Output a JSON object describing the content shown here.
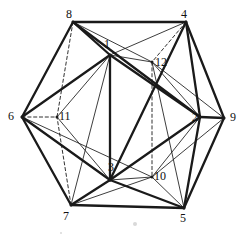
{
  "figure": {
    "type": "diagram",
    "background_color": "#ffffff",
    "line_color": "#1a1a1a",
    "label_color": "#111111",
    "width": 247,
    "height": 237
  },
  "graph_data": {
    "type": "graph",
    "vertex_count": 12,
    "edge_count": 30,
    "vertices": [
      {
        "id": "v1",
        "label": "1",
        "x": 110,
        "y": 55,
        "lx": 104,
        "ly": 38,
        "ring": "inner"
      },
      {
        "id": "v2",
        "label": "2",
        "x": 200,
        "y": 117,
        "lx": 192,
        "ly": 111,
        "ring": "inner"
      },
      {
        "id": "v3",
        "label": "3",
        "x": 110,
        "y": 180,
        "lx": 108,
        "ly": 161,
        "ring": "inner"
      },
      {
        "id": "v4",
        "label": "4",
        "x": 186,
        "y": 22,
        "lx": 181,
        "ly": 8,
        "ring": "outer"
      },
      {
        "id": "v5",
        "label": "5",
        "x": 184,
        "y": 208,
        "lx": 180,
        "ly": 212,
        "ring": "outer"
      },
      {
        "id": "v6",
        "label": "6",
        "x": 22,
        "y": 117,
        "lx": 8,
        "ly": 110,
        "ring": "outer"
      },
      {
        "id": "v7",
        "label": "7",
        "x": 71,
        "y": 205,
        "lx": 63,
        "ly": 210,
        "ring": "outer"
      },
      {
        "id": "v8",
        "label": "8",
        "x": 73,
        "y": 22,
        "lx": 66,
        "ly": 8,
        "ring": "outer"
      },
      {
        "id": "v9",
        "label": "9",
        "x": 224,
        "y": 118,
        "lx": 230,
        "ly": 111,
        "ring": "outer"
      },
      {
        "id": "v10",
        "label": "10",
        "x": 152,
        "y": 177,
        "lx": 154,
        "ly": 170,
        "ring": "inner"
      },
      {
        "id": "v11",
        "label": "11",
        "x": 57,
        "y": 117,
        "lx": 59,
        "ly": 110,
        "ring": "inner"
      },
      {
        "id": "v12",
        "label": "12",
        "x": 152,
        "y": 62,
        "lx": 155,
        "ly": 56,
        "ring": "inner"
      }
    ],
    "edges": [
      {
        "from": "v8",
        "to": "v4",
        "style": "solid",
        "weight": "bold"
      },
      {
        "from": "v4",
        "to": "v9",
        "style": "solid",
        "weight": "bold"
      },
      {
        "from": "v9",
        "to": "v5",
        "style": "solid",
        "weight": "bold"
      },
      {
        "from": "v5",
        "to": "v7",
        "style": "solid",
        "weight": "bold"
      },
      {
        "from": "v7",
        "to": "v6",
        "style": "solid",
        "weight": "bold"
      },
      {
        "from": "v6",
        "to": "v8",
        "style": "solid",
        "weight": "bold"
      },
      {
        "from": "v8",
        "to": "v1",
        "style": "solid",
        "weight": "bold"
      },
      {
        "from": "v4",
        "to": "v2",
        "style": "solid",
        "weight": "bold"
      },
      {
        "from": "v9",
        "to": "v2",
        "style": "solid",
        "weight": "bold"
      },
      {
        "from": "v5",
        "to": "v3",
        "style": "solid",
        "weight": "bold"
      },
      {
        "from": "v7",
        "to": "v3",
        "style": "solid",
        "weight": "bold"
      },
      {
        "from": "v6",
        "to": "v1",
        "style": "solid",
        "weight": "bold"
      },
      {
        "from": "v1",
        "to": "v2",
        "style": "solid",
        "weight": "bold"
      },
      {
        "from": "v2",
        "to": "v3",
        "style": "solid",
        "weight": "bold"
      },
      {
        "from": "v3",
        "to": "v1",
        "style": "solid",
        "weight": "bold"
      },
      {
        "from": "v8",
        "to": "v12",
        "style": "solid",
        "weight": "thin"
      },
      {
        "from": "v4",
        "to": "v1",
        "style": "solid",
        "weight": "thin"
      },
      {
        "from": "v4",
        "to": "v12",
        "style": "dashed",
        "weight": "thin"
      },
      {
        "from": "v9",
        "to": "v12",
        "style": "solid",
        "weight": "thin"
      },
      {
        "from": "v2",
        "to": "v12",
        "style": "solid",
        "weight": "thin"
      },
      {
        "from": "v1",
        "to": "v12",
        "style": "solid",
        "weight": "thin"
      },
      {
        "from": "v9",
        "to": "v10",
        "style": "solid",
        "weight": "thin"
      },
      {
        "from": "v5",
        "to": "v10",
        "style": "solid",
        "weight": "thin"
      },
      {
        "from": "v5",
        "to": "v2",
        "style": "solid",
        "weight": "bold"
      },
      {
        "from": "v2",
        "to": "v10",
        "style": "solid",
        "weight": "thin"
      },
      {
        "from": "v3",
        "to": "v10",
        "style": "solid",
        "weight": "thin"
      },
      {
        "from": "v12",
        "to": "v10",
        "style": "dashed",
        "weight": "thin"
      },
      {
        "from": "v6",
        "to": "v11",
        "style": "dashed",
        "weight": "thin"
      },
      {
        "from": "v8",
        "to": "v11",
        "style": "dashed",
        "weight": "thin"
      },
      {
        "from": "v7",
        "to": "v11",
        "style": "dashed",
        "weight": "thin"
      },
      {
        "from": "v1",
        "to": "v11",
        "style": "solid",
        "weight": "thin"
      },
      {
        "from": "v3",
        "to": "v11",
        "style": "solid",
        "weight": "thin"
      },
      {
        "from": "v6",
        "to": "v3",
        "style": "solid",
        "weight": "bold"
      },
      {
        "from": "v6",
        "to": "v10",
        "style": "solid",
        "weight": "thin"
      },
      {
        "from": "v7",
        "to": "v10",
        "style": "solid",
        "weight": "thin"
      },
      {
        "from": "v8",
        "to": "v2",
        "style": "solid",
        "weight": "bold"
      },
      {
        "from": "v4",
        "to": "v3",
        "style": "solid",
        "weight": "bold"
      },
      {
        "from": "v7",
        "to": "v1",
        "style": "solid",
        "weight": "thin"
      },
      {
        "from": "v5",
        "to": "v12",
        "style": "solid",
        "weight": "thin"
      }
    ],
    "specks": [
      {
        "x": 133,
        "y": 222,
        "r": 2
      },
      {
        "x": 60,
        "y": 232,
        "r": 1
      }
    ]
  }
}
